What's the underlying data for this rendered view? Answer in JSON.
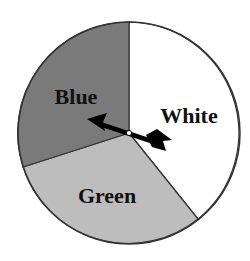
{
  "spinner": {
    "sectors": [
      {
        "label": "White",
        "color": "#ffffff",
        "start_deg": -90,
        "end_deg": 51
      },
      {
        "label": "Green",
        "color": "#bdbdbd",
        "start_deg": 51,
        "end_deg": 162
      },
      {
        "label": "Blue",
        "color": "#7a7a7a",
        "start_deg": 162,
        "end_deg": 270
      }
    ],
    "pointer": {
      "points_to": "Blue"
    },
    "outline_color": "#333333"
  }
}
